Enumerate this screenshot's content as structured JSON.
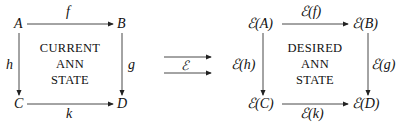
{
  "left_diagram": {
    "nodes": {
      "A": "A",
      "B": "B",
      "C": "C",
      "D": "D"
    },
    "arrows": {
      "top": "f",
      "right": "g",
      "left": "h",
      "bottom": "k"
    },
    "center_text": [
      "CURRENT",
      "ANN",
      "STATE"
    ]
  },
  "functor": {
    "label": "ℰ"
  },
  "right_diagram": {
    "nodes": {
      "A": "ℰ(A)",
      "B": "ℰ(B)",
      "C": "ℰ(C)",
      "D": "ℰ(D)"
    },
    "arrows": {
      "top": "ℰ(f)",
      "right": "ℰ(g)",
      "left": "ℰ(h)",
      "bottom": "ℰ(k)"
    },
    "center_text": [
      "DESIRED",
      "ANN",
      "STATE"
    ]
  }
}
